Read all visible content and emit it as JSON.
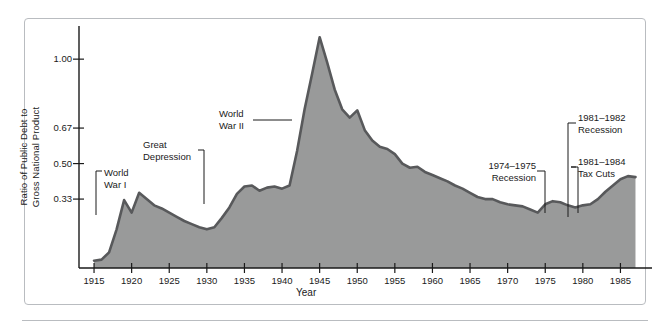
{
  "chart_data": {
    "type": "area",
    "title": "",
    "xlabel": "Year",
    "ylabel": "Ratio of Public Debt to Gross National Product",
    "ylabel_line1": "Ratio of Public Debt to",
    "ylabel_line2": "Gross National Product",
    "xlim": [
      1913,
      1988
    ],
    "ylim": [
      0,
      1.13
    ],
    "grid": false,
    "legend": null,
    "xticks": [
      1915,
      1920,
      1925,
      1930,
      1935,
      1940,
      1945,
      1950,
      1955,
      1960,
      1965,
      1970,
      1975,
      1980,
      1985
    ],
    "xtick_labels": [
      "1915",
      "1920",
      "1925",
      "1930",
      "1935",
      "1940",
      "1945",
      "1950",
      "1955",
      "1960",
      "1965",
      "1970",
      "1975",
      "1980",
      "1985"
    ],
    "yticks": [
      0.33,
      0.5,
      0.67,
      1.0
    ],
    "ytick_labels": [
      "0.33",
      "0.50",
      "0.67",
      "1.00"
    ],
    "series_name": "Ratio of Public Debt to Gross National Product",
    "x": [
      1915,
      1916,
      1917,
      1918,
      1919,
      1920,
      1921,
      1922,
      1923,
      1924,
      1925,
      1926,
      1927,
      1928,
      1929,
      1930,
      1931,
      1932,
      1933,
      1934,
      1935,
      1936,
      1937,
      1938,
      1939,
      1940,
      1941,
      1942,
      1943,
      1944,
      1945,
      1946,
      1947,
      1948,
      1949,
      1950,
      1951,
      1952,
      1953,
      1954,
      1955,
      1956,
      1957,
      1958,
      1959,
      1960,
      1961,
      1962,
      1963,
      1964,
      1965,
      1966,
      1967,
      1968,
      1969,
      1970,
      1971,
      1972,
      1973,
      1974,
      1975,
      1976,
      1977,
      1978,
      1979,
      1980,
      1981,
      1982,
      1983,
      1984,
      1985,
      1986,
      1987
    ],
    "values": [
      0.035,
      0.04,
      0.075,
      0.185,
      0.325,
      0.265,
      0.36,
      0.33,
      0.3,
      0.285,
      0.265,
      0.245,
      0.225,
      0.21,
      0.195,
      0.185,
      0.195,
      0.24,
      0.29,
      0.355,
      0.39,
      0.395,
      0.37,
      0.385,
      0.39,
      0.38,
      0.395,
      0.56,
      0.76,
      0.93,
      1.105,
      0.985,
      0.855,
      0.76,
      0.72,
      0.755,
      0.66,
      0.61,
      0.58,
      0.57,
      0.545,
      0.5,
      0.48,
      0.485,
      0.46,
      0.445,
      0.43,
      0.415,
      0.395,
      0.38,
      0.36,
      0.34,
      0.33,
      0.33,
      0.315,
      0.305,
      0.3,
      0.295,
      0.28,
      0.265,
      0.305,
      0.32,
      0.315,
      0.3,
      0.29,
      0.3,
      0.305,
      0.33,
      0.365,
      0.395,
      0.425,
      0.44,
      0.435
    ],
    "area_fill": "#999a9a",
    "line_color": "#58595b"
  },
  "annotations": [
    {
      "id": "world-war-i",
      "label_line1": "World",
      "label_line2": "War I",
      "full": "World War I"
    },
    {
      "id": "great-depression",
      "label_line1": "Great",
      "label_line2": "Depression",
      "full": "Great Depression"
    },
    {
      "id": "world-war-ii",
      "label_line1": "World",
      "label_line2": "War II",
      "full": "World War II"
    },
    {
      "id": "recession-1974-1975",
      "label_line1": "1974–1975",
      "label_line2": "Recession",
      "full": "1974–1975 Recession"
    },
    {
      "id": "recession-1981-1982",
      "label_line1": "1981–1982",
      "label_line2": "Recession",
      "full": "1981–1982 Recession"
    },
    {
      "id": "tax-cuts-1981-1984",
      "label_line1": "1981–1984",
      "label_line2": "Tax Cuts",
      "full": "1981–1984 Tax Cuts"
    }
  ],
  "colors": {
    "area_fill": "#999a9a",
    "line_color": "#58595b",
    "axis": "#1a1a1a",
    "frame": "#b9bcc0",
    "background": "#ffffff"
  }
}
